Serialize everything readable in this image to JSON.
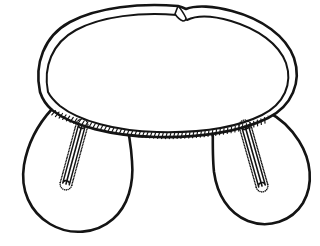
{
  "figure": {
    "title": "Line drawing of a brimmed cap body with two ear flaps",
    "style": "black ink line art on white background",
    "canvas": {
      "width": 320,
      "height": 246,
      "background_color": "#ffffff",
      "ink_color": "#141414"
    },
    "parts": [
      {
        "id": "crown-band",
        "label": "Crown band",
        "description": "Large oval band forming the top of the cap, drawn as a double outline with a narrow rim",
        "notch": {
          "label": "Band notch",
          "description": "Open notch where the band end overlaps itself, near the top centre-right",
          "x": 192,
          "y": 14
        }
      },
      {
        "id": "left-flap",
        "label": "Left ear flap",
        "description": "Teardrop shaped flap hanging from the lower-left of the band"
      },
      {
        "id": "right-flap",
        "label": "Right ear flap",
        "description": "Teardrop shaped flap hanging from the lower-right of the band"
      },
      {
        "id": "band-seam-stitching",
        "label": "Band seam stitching",
        "description": "Row of short hatch stitches along the lower edge of the crown band"
      },
      {
        "id": "left-buttonhole",
        "label": "Left buttonhole",
        "description": "Slanted buttonhole slot with dotted stitching, leaning top-right to bottom-left",
        "angle_degrees": 17
      },
      {
        "id": "right-buttonhole",
        "label": "Right buttonhole",
        "description": "Slanted buttonhole slot with dotted stitching, leaning top-left to bottom-right",
        "angle_degrees": -19
      }
    ]
  },
  "geometry": {
    "band_outer": "M 40 92 C 34 64, 44 36, 70 22 C 98 7, 140 3, 178 6 C 178 6, 182 7, 186 9 C 196 5, 214 6, 232 11 C 262 19, 286 36, 294 58 C 302 82, 292 106, 268 118 C 240 132, 198 138, 156 137 C 112 136, 72 126, 52 110 C 45 104, 42 98, 40 92 Z",
    "band_inner": "M 48 92 C 43 67, 52 43, 76 30 C 102 16, 141 12, 177 15 C 180 16, 184 18, 187 20 C 197 15, 214 16, 231 21 C 258 29, 279 44, 286 63 C 293 84, 284 104, 262 115 C 236 128, 197 133, 157 132 C 116 131, 79 121, 60 106 C 53 100, 50 96, 48 92 Z",
    "notch_tip": "M 178 6 C 181 9, 184 14, 186 18 C 186 20, 185 21, 183 21 C 180 20, 177 17, 175 14 Z",
    "left_flap": "M 52 109 C 40 122, 28 142, 24 165 C 20 190, 30 212, 50 224 C 70 236, 96 234, 113 219 C 128 206, 134 184, 132 161 C 131 144, 128 128, 124 112 L 122 106 Z",
    "right_flap": "M 213 113 C 213 132, 212 154, 214 172 C 217 194, 228 213, 248 221 C 269 229, 292 221, 303 203 C 314 184, 311 160, 299 141 C 290 127, 278 117, 268 112 Z",
    "band_seam": "M 52 109 C 80 122, 120 131, 160 133 C 200 134, 240 128, 268 116",
    "left_slot": "M 82 125 L 66 184",
    "right_slot": "M 245 126 L 262 186"
  },
  "stitching": {
    "band_hatch_count": 58,
    "buttonhole_dot_count": 40
  }
}
